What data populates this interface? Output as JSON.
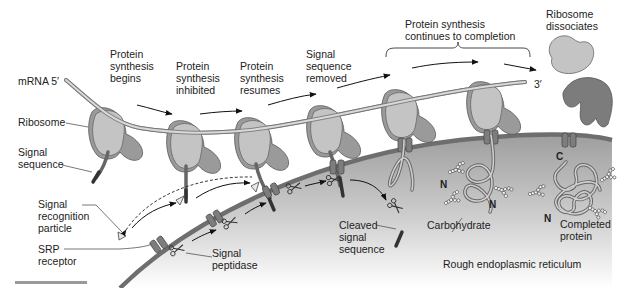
{
  "figure": {
    "colors": {
      "background": "#ffffff",
      "er_lumen": "#c9c9c9",
      "er_membrane": "#6e6e6e",
      "ribosome_large": "#9a9a9a",
      "ribosome_small": "#c4c4c4",
      "text": "#222222"
    }
  },
  "labels": {
    "mrna_5": "mRNA 5′",
    "mrna_3": "3′",
    "ribosome": "Ribosome",
    "signal_sequence": [
      "Signal",
      "sequence"
    ],
    "srp": [
      "Signal",
      "recognition",
      "particle"
    ],
    "srp_receptor": [
      "SRP",
      "receptor"
    ],
    "signal_peptidase": [
      "Signal",
      "peptidase"
    ],
    "cleaved_signal_sequence": [
      "Cleaved",
      "signal",
      "sequence"
    ],
    "carbohydrate": "Carbohydrate",
    "completed_protein": [
      "Completed",
      "protein"
    ],
    "rough_er": "Rough endoplasmic reticulum",
    "n_terminus": "N",
    "c_terminus": "C"
  },
  "steps": [
    {
      "id": "begins",
      "lines": [
        "Protein",
        "synthesis",
        "begins"
      ]
    },
    {
      "id": "inhibited",
      "lines": [
        "Protein",
        "synthesis",
        "inhibited"
      ]
    },
    {
      "id": "resumes",
      "lines": [
        "Protein",
        "synthesis",
        "resumes"
      ]
    },
    {
      "id": "removed",
      "lines": [
        "Signal",
        "sequence",
        "removed"
      ]
    },
    {
      "id": "completion",
      "lines": [
        "Protein synthesis",
        "continues to completion"
      ]
    },
    {
      "id": "dissociates",
      "lines": [
        "Ribosome",
        "dissociates"
      ]
    }
  ]
}
